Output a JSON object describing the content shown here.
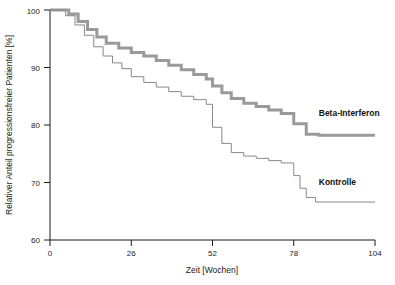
{
  "chart_data": {
    "type": "line",
    "title": "",
    "xlabel": "Zeit [Wochen]",
    "ylabel": "Relativer Anteil progressionsfreier Patienten [%]",
    "xlim": [
      0,
      104
    ],
    "ylim": [
      60,
      100
    ],
    "xticks": [
      0,
      26,
      52,
      78,
      104
    ],
    "yticks": [
      60,
      70,
      80,
      90,
      100
    ],
    "grid": false,
    "legend_position": "inline-right",
    "series": [
      {
        "name": "Beta-Interferon",
        "color": "#9a9a9a",
        "linewidth": 3,
        "label_x": 86,
        "label_y": 80.6,
        "points": [
          [
            0,
            100
          ],
          [
            6,
            100
          ],
          [
            6,
            99.3
          ],
          [
            9,
            99.3
          ],
          [
            9,
            98.0
          ],
          [
            12,
            98.0
          ],
          [
            12,
            96.6
          ],
          [
            15,
            96.6
          ],
          [
            15,
            95.3
          ],
          [
            18,
            95.3
          ],
          [
            18,
            94.2
          ],
          [
            22,
            94.2
          ],
          [
            22,
            93.4
          ],
          [
            26,
            93.4
          ],
          [
            26,
            92.6
          ],
          [
            30,
            92.6
          ],
          [
            30,
            92.0
          ],
          [
            34,
            92.0
          ],
          [
            34,
            91.2
          ],
          [
            38,
            91.2
          ],
          [
            38,
            90.4
          ],
          [
            42,
            90.4
          ],
          [
            42,
            89.6
          ],
          [
            46,
            89.6
          ],
          [
            46,
            88.8
          ],
          [
            50,
            88.8
          ],
          [
            50,
            88.0
          ],
          [
            52,
            88.0
          ],
          [
            52,
            86.8
          ],
          [
            55,
            86.8
          ],
          [
            55,
            85.6
          ],
          [
            58,
            85.6
          ],
          [
            58,
            84.6
          ],
          [
            62,
            84.6
          ],
          [
            62,
            83.8
          ],
          [
            66,
            83.8
          ],
          [
            66,
            83.2
          ],
          [
            70,
            83.2
          ],
          [
            70,
            82.6
          ],
          [
            74,
            82.6
          ],
          [
            74,
            82.0
          ],
          [
            78,
            82.0
          ],
          [
            78,
            80.2
          ],
          [
            82,
            80.2
          ],
          [
            82,
            78.4
          ],
          [
            86,
            78.4
          ],
          [
            86,
            78.2
          ],
          [
            104,
            78.2
          ]
        ]
      },
      {
        "name": "Kontrolle",
        "color": "#888888",
        "linewidth": 1,
        "label_x": 86,
        "label_y": 68.6,
        "points": [
          [
            0,
            100
          ],
          [
            5,
            100
          ],
          [
            5,
            99.0
          ],
          [
            8,
            99.0
          ],
          [
            8,
            97.4
          ],
          [
            11,
            97.4
          ],
          [
            11,
            95.6
          ],
          [
            14,
            95.6
          ],
          [
            14,
            93.6
          ],
          [
            17,
            93.6
          ],
          [
            17,
            92.0
          ],
          [
            20,
            92.0
          ],
          [
            20,
            90.8
          ],
          [
            23,
            90.8
          ],
          [
            23,
            89.8
          ],
          [
            26,
            89.8
          ],
          [
            26,
            88.4
          ],
          [
            30,
            88.4
          ],
          [
            30,
            87.4
          ],
          [
            34,
            87.4
          ],
          [
            34,
            86.6
          ],
          [
            38,
            86.6
          ],
          [
            38,
            85.8
          ],
          [
            42,
            85.8
          ],
          [
            42,
            85.0
          ],
          [
            46,
            85.0
          ],
          [
            46,
            84.4
          ],
          [
            50,
            84.4
          ],
          [
            50,
            83.6
          ],
          [
            52,
            83.6
          ],
          [
            52,
            79.6
          ],
          [
            55,
            79.6
          ],
          [
            55,
            76.8
          ],
          [
            58,
            76.8
          ],
          [
            58,
            75.2
          ],
          [
            62,
            75.2
          ],
          [
            62,
            74.6
          ],
          [
            66,
            74.6
          ],
          [
            66,
            74.2
          ],
          [
            70,
            74.2
          ],
          [
            70,
            73.8
          ],
          [
            74,
            73.8
          ],
          [
            74,
            73.4
          ],
          [
            78,
            73.4
          ],
          [
            78,
            71.2
          ],
          [
            80,
            71.2
          ],
          [
            80,
            69.0
          ],
          [
            82,
            69.0
          ],
          [
            82,
            67.4
          ],
          [
            85,
            67.4
          ],
          [
            85,
            66.6
          ],
          [
            104,
            66.6
          ]
        ]
      }
    ]
  },
  "axes": {
    "x_title": "Zeit [Wochen]",
    "y_title": "Relativer Anteil progressionsfreier Patienten [%]",
    "x_tick_labels": [
      "0",
      "26",
      "52",
      "78",
      "104"
    ],
    "y_tick_labels": [
      "60",
      "70",
      "80",
      "90",
      "100"
    ]
  },
  "labels": {
    "beta_interferon": "Beta-Interferon",
    "kontrolle": "Kontrolle"
  },
  "colors": {
    "axis": "#1a1a1a",
    "beta_interferon": "#9a9a9a",
    "kontrolle": "#888888",
    "background": "#ffffff"
  }
}
